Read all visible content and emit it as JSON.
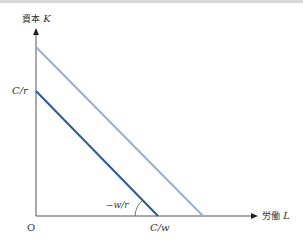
{
  "diagram": {
    "y_axis": {
      "label_jp": "資本",
      "label_var": "K"
    },
    "x_axis": {
      "label_jp": "労働",
      "label_var": "L"
    },
    "origin_label": "O",
    "y_intercept_label": "C/r",
    "x_intercept_label": "C/w",
    "slope_label": "−w/r",
    "colors": {
      "inner_line": "#2a5a9a",
      "outer_line": "#9ab0cc",
      "axis": "#555555"
    },
    "lines": [
      {
        "name": "isocost-inner",
        "from": [
          36,
          91
        ],
        "to": [
          158,
          216
        ]
      },
      {
        "name": "isocost-outer",
        "from": [
          36,
          47
        ],
        "to": [
          203,
          216
        ]
      }
    ]
  }
}
